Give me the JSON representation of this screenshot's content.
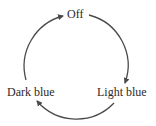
{
  "diagram": {
    "type": "state-cycle",
    "nodes": [
      {
        "id": "off",
        "label": "Off"
      },
      {
        "id": "light_blue",
        "label": "Light blue"
      },
      {
        "id": "dark_blue",
        "label": "Dark blue"
      }
    ],
    "edges": [
      {
        "from": "Off",
        "to": "Light blue"
      },
      {
        "from": "Light blue",
        "to": "Dark blue"
      },
      {
        "from": "Dark blue",
        "to": "Off"
      }
    ],
    "colors": {
      "stroke": "#4a4a4a",
      "text": "#2a2a2a",
      "background": "#ffffff"
    }
  }
}
